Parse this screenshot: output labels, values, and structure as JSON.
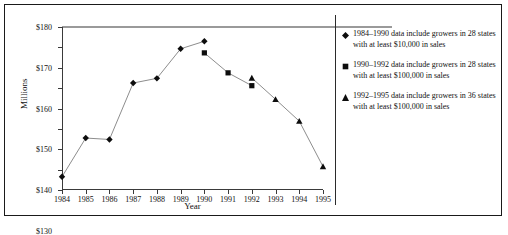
{
  "chart_data": {
    "type": "line",
    "title": "",
    "xlabel": "Year",
    "ylabel": "Millions",
    "x": [
      1984,
      1985,
      1986,
      1987,
      1988,
      1989,
      1990,
      1991,
      1992,
      1993,
      1994,
      1995
    ],
    "xlim": [
      1984,
      1995
    ],
    "ylim": [
      100,
      180
    ],
    "ytick_labels": [
      "$100",
      "$110",
      "$120",
      "$130",
      "$140",
      "$150",
      "$160",
      "$170",
      "$180"
    ],
    "ytick_values": [
      100,
      110,
      120,
      130,
      140,
      150,
      160,
      170,
      180
    ],
    "xtick_labels": [
      "1984",
      "1985",
      "1986",
      "1987",
      "1988",
      "1989",
      "1990",
      "1991",
      "1992",
      "1993",
      "1994",
      "1995"
    ],
    "grid": false,
    "legend_position": "right",
    "series": [
      {
        "name": "1984-1990",
        "marker": "diamond",
        "x": [
          1984,
          1985,
          1986,
          1987,
          1988,
          1989,
          1990
        ],
        "values": [
          106.5,
          125.5,
          124.8,
          152.5,
          154.8,
          169.3,
          173.0
        ]
      },
      {
        "name": "1990-1992",
        "marker": "square",
        "x": [
          1990,
          1991,
          1992
        ],
        "values": [
          167.3,
          157.5,
          151.2
        ]
      },
      {
        "name": "1992-1995",
        "marker": "triangle",
        "x": [
          1992,
          1993,
          1994,
          1995
        ],
        "values": [
          155.0,
          144.5,
          133.8,
          111.5
        ]
      }
    ]
  },
  "legend": {
    "entries": [
      {
        "marker_name": "diamond-marker",
        "text": "1984–1990 data include growers in 28 states with at least $10,000 in sales"
      },
      {
        "marker_name": "square-marker",
        "text": "1990–1992 data include growers in 28 states with at least $100,000 in sales"
      },
      {
        "marker_name": "triangle-marker",
        "text": "1992–1995 data include growers in 36 states with at least $100,000 in sales"
      }
    ]
  },
  "colors": {
    "marker": "#0d0d0d",
    "line": "#8d8d8d",
    "axis": "#3a3a3a",
    "border": "#1a1a1a",
    "text": "#111111"
  }
}
